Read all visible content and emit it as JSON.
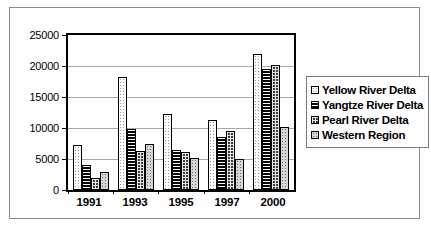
{
  "chart_data": {
    "type": "bar",
    "title": "",
    "xlabel": "",
    "ylabel": "",
    "categories": [
      "1991",
      "1993",
      "1995",
      "1997",
      "2000"
    ],
    "series": [
      {
        "name": "Yellow River Delta",
        "values": [
          7300,
          18200,
          12200,
          11300,
          22000
        ]
      },
      {
        "name": "Yangtze River Delta",
        "values": [
          4000,
          9800,
          6500,
          8600,
          19500
        ]
      },
      {
        "name": "Pearl River Delta",
        "values": [
          2000,
          6300,
          6200,
          9500,
          20200
        ]
      },
      {
        "name": "Western Region",
        "values": [
          2900,
          7500,
          5200,
          5000,
          10100
        ]
      }
    ],
    "ylim": [
      0,
      25000
    ],
    "yticks": [
      0,
      5000,
      10000,
      15000,
      20000,
      25000
    ],
    "ytick_labels": [
      "0",
      "5000",
      "10000",
      "15000",
      "20000",
      "25000"
    ],
    "grid": true,
    "legend_position": "right"
  },
  "legend": {
    "items": [
      {
        "label": "Yellow River Delta",
        "pattern": "white-dotted"
      },
      {
        "label": "Yangtze River Delta",
        "pattern": "black-horizontal-stripes"
      },
      {
        "label": "Pearl River Delta",
        "pattern": "dark-checkered"
      },
      {
        "label": "Western Region",
        "pattern": "gray-dotted"
      }
    ]
  }
}
